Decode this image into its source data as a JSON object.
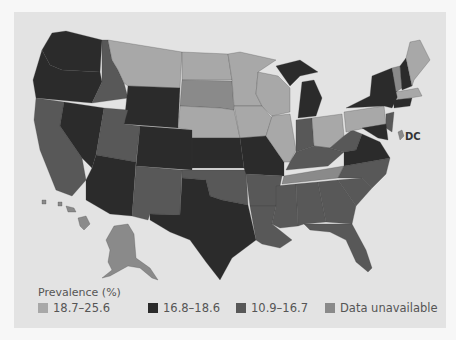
{
  "map": {
    "title": "US prevalence choropleth",
    "dc_label": "DC",
    "colors": {
      "high": "#a8a8a8",
      "upper_mid": "#2b2b2b",
      "lower_mid": "#585858",
      "unavailable": "#8a8a8a"
    }
  },
  "legend": {
    "title": "Prevalence (%)",
    "items": [
      {
        "label": "18.7–25.6",
        "color": "#a8a8a8"
      },
      {
        "label": "16.8–18.6",
        "color": "#2b2b2b"
      },
      {
        "label": "10.9–16.7",
        "color": "#585858"
      },
      {
        "label": "Data unavailable",
        "color": "#8a8a8a"
      }
    ]
  }
}
